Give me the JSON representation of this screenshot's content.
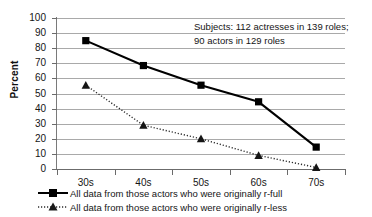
{
  "chart_data": {
    "type": "line",
    "title": "",
    "xlabel": "",
    "ylabel": "Percent",
    "categories": [
      "30s",
      "40s",
      "50s",
      "60s",
      "70s"
    ],
    "ylim": [
      0,
      100
    ],
    "yticks": [
      0,
      10,
      20,
      30,
      40,
      50,
      60,
      70,
      80,
      90,
      100
    ],
    "ytick_labels": [
      "0",
      "10",
      "20",
      "30",
      "40",
      "50",
      "60",
      "70",
      "80",
      "90",
      "100"
    ],
    "grid": true,
    "legend_position": "bottom-left",
    "annotation": {
      "line1": "Subjects: 112 actresses in 139 roles;",
      "line2": "90 actors in 129 roles"
    },
    "series": [
      {
        "name": "All data from those actors who were originally r-full",
        "values": [
          85,
          68.5,
          55.5,
          44.5,
          14.5
        ],
        "marker": "square",
        "linestyle": "solid",
        "color": "#000000"
      },
      {
        "name": "All data from those actors who were originally r-less",
        "values": [
          55.5,
          29,
          20,
          9,
          1
        ],
        "marker": "triangle",
        "linestyle": "dotted",
        "color": "#2b2b2b"
      }
    ]
  },
  "colors": {
    "background": "#ffffff",
    "gridline": "#a9a9a9",
    "axis": "#6b6b6b",
    "text": "#151515",
    "series_full": "#000000",
    "series_less": "#2b2b2b"
  }
}
